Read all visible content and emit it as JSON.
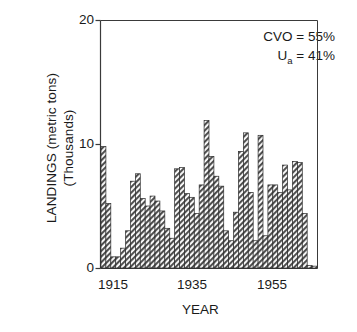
{
  "chart_data": {
    "type": "bar",
    "title": "",
    "xlabel": "YEAR",
    "ylabel": "LANDINGS (metric tons) (Thousands)",
    "ylabel_line1": "LANDINGS (metric tons)",
    "ylabel_line2": "(Thousands)",
    "xlim": [
      1914,
      1959
    ],
    "ylim": [
      0,
      20
    ],
    "ytick_labels": [
      "0",
      "10",
      "20"
    ],
    "yticks": [
      0,
      10,
      20
    ],
    "xtick_labels": [
      "1915",
      "1935",
      "1955"
    ],
    "xticks": [
      1915,
      1935,
      1955
    ],
    "grid": false,
    "legend": "none",
    "bar_fill": "diagonal-hatch",
    "bar_color": "#4a4a4a",
    "frame_color": "#3a3a3a",
    "background": "#ffffff",
    "categories": [
      1915,
      1916,
      1917,
      1918,
      1919,
      1920,
      1921,
      1922,
      1923,
      1924,
      1925,
      1926,
      1927,
      1928,
      1929,
      1930,
      1931,
      1932,
      1933,
      1934,
      1935,
      1936,
      1937,
      1938,
      1939,
      1940,
      1941,
      1942,
      1943,
      1944,
      1945,
      1946,
      1947,
      1948,
      1949,
      1950,
      1951,
      1952,
      1953,
      1954,
      1955,
      1956,
      1957,
      1958
    ],
    "values": [
      9.8,
      5.2,
      0.9,
      0.9,
      1.6,
      3.0,
      7.0,
      7.6,
      5.6,
      5.0,
      5.8,
      5.4,
      4.6,
      3.2,
      2.4,
      8.0,
      8.1,
      6.0,
      5.7,
      4.4,
      6.7,
      11.9,
      9.0,
      7.4,
      6.6,
      3.0,
      2.2,
      4.5,
      9.4,
      10.9,
      6.1,
      2.2,
      10.7,
      2.6,
      6.7,
      6.7,
      6.1,
      8.3,
      6.3,
      8.6,
      8.5,
      4.4,
      0.2,
      0.15
    ],
    "annotations": [
      {
        "label": "CVO",
        "value": "55%",
        "text": "CVO = 55%"
      },
      {
        "label": "Ua",
        "value": "41%",
        "text": "U_a = 41%"
      }
    ],
    "annotation_line1_prefix": "CVO = ",
    "annotation_line1_value": "55%",
    "annotation_line2_prefix": "U",
    "annotation_line2_sub": "a",
    "annotation_line2_rest": " = 41%"
  }
}
